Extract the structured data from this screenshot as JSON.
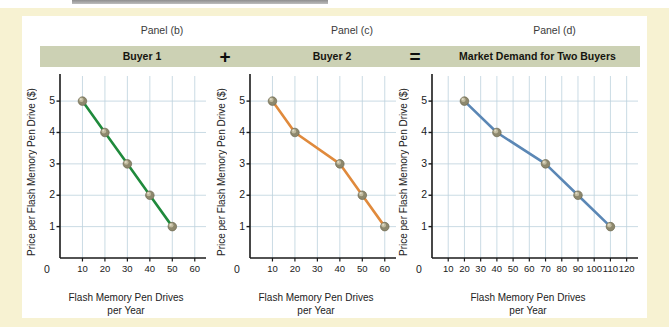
{
  "figure": {
    "background_color": "#f7f2d2",
    "band_color": "#ccd1b4",
    "grid_color": "#bcd2dd",
    "axis_color": "#1a1a1a",
    "marker_color": "#a9a287"
  },
  "panels": [
    {
      "caption": "Panel (b)",
      "band_title": "Buyer 1",
      "operator": "",
      "chart_data": {
        "type": "line",
        "title": "Buyer 1",
        "xlabel": "Flash Memory Pen Drives per Year",
        "ylabel": "Price per Flash Memory Pen Drive ($)",
        "series": [
          {
            "name": "Buyer 1 demand",
            "color": "#1f8a3c",
            "x": [
              10,
              20,
              30,
              40,
              50
            ],
            "y": [
              5,
              4,
              3,
              2,
              1
            ]
          }
        ],
        "xticks": [
          0,
          10,
          20,
          30,
          40,
          50,
          60
        ],
        "yticks": [
          1,
          2,
          3,
          4,
          5
        ],
        "xlim": [
          0,
          65
        ],
        "ylim": [
          0,
          5.8
        ],
        "grid": true,
        "legend": "none"
      }
    },
    {
      "caption": "Panel (c)",
      "band_title": "Buyer 2",
      "operator": "+",
      "chart_data": {
        "type": "line",
        "title": "Buyer 2",
        "xlabel": "Flash Memory Pen Drives per Year",
        "ylabel": "Price per Flash Memory Pen Drive ($)",
        "series": [
          {
            "name": "Buyer 2 demand",
            "color": "#e08a3c",
            "x": [
              10,
              20,
              40,
              50,
              60
            ],
            "y": [
              5,
              4,
              3,
              2,
              1
            ]
          }
        ],
        "xticks": [
          0,
          10,
          20,
          30,
          40,
          50,
          60
        ],
        "yticks": [
          1,
          2,
          3,
          4,
          5
        ],
        "xlim": [
          0,
          65
        ],
        "ylim": [
          0,
          5.8
        ],
        "grid": true,
        "legend": "none"
      }
    },
    {
      "caption": "Panel (d)",
      "band_title": "Market Demand for Two Buyers",
      "operator": "=",
      "chart_data": {
        "type": "line",
        "title": "Market Demand for Two Buyers",
        "xlabel": "Flash Memory Pen Drives per Year",
        "ylabel": "Price per Flash Memory Pen Drive ($)",
        "series": [
          {
            "name": "Market demand",
            "color": "#5b87b5",
            "x": [
              20,
              40,
              70,
              90,
              110
            ],
            "y": [
              5,
              4,
              3,
              2,
              1
            ]
          }
        ],
        "xticks": [
          0,
          10,
          20,
          30,
          40,
          50,
          60,
          70,
          80,
          90,
          100,
          110,
          120
        ],
        "yticks": [
          1,
          2,
          3,
          4,
          5
        ],
        "xlim": [
          0,
          127
        ],
        "ylim": [
          0,
          5.8
        ],
        "grid": true,
        "legend": "none"
      }
    }
  ],
  "axis_text": {
    "ylabel": "Price per Flash Memory Pen Drive ($)",
    "xlabel_line1": "Flash Memory Pen Drives",
    "xlabel_line2": "per Year",
    "origin": "0"
  }
}
